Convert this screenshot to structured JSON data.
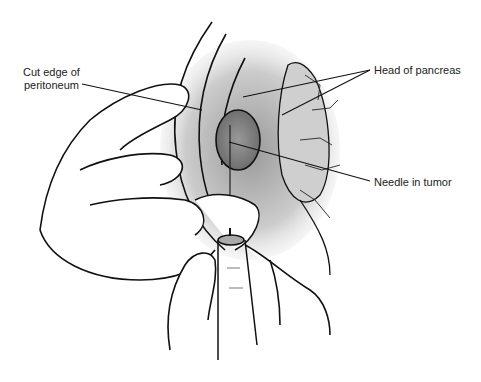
{
  "figure": {
    "type": "medical-illustration",
    "labels": {
      "cut_edge_line1": "Cut edge of",
      "cut_edge_line2": "peritoneum",
      "head_of_pancreas": "Head of pancreas",
      "needle_in_tumor": "Needle in tumor"
    }
  }
}
